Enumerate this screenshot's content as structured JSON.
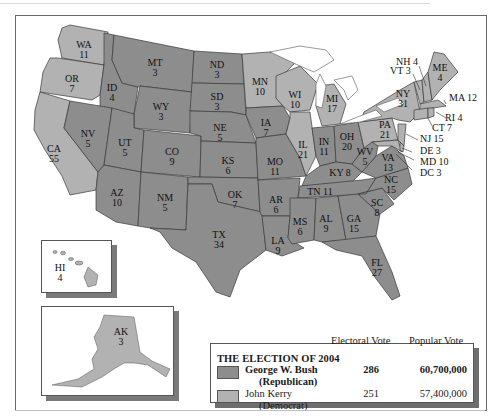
{
  "map": {
    "title": "THE ELECTION OF 2004",
    "colors": {
      "republican": "#8d8d8d",
      "democrat": "#b2b2b2",
      "water": "#ffffff",
      "border": "#3a3a3a"
    },
    "states": {
      "WA": {
        "label": "WA",
        "votes": "11",
        "party": "democrat"
      },
      "OR": {
        "label": "OR",
        "votes": "7",
        "party": "democrat"
      },
      "CA": {
        "label": "CA",
        "votes": "55",
        "party": "democrat"
      },
      "ID": {
        "label": "ID",
        "votes": "4",
        "party": "republican"
      },
      "NV": {
        "label": "NV",
        "votes": "5",
        "party": "republican"
      },
      "MT": {
        "label": "MT",
        "votes": "3",
        "party": "republican"
      },
      "WY": {
        "label": "WY",
        "votes": "3",
        "party": "republican"
      },
      "UT": {
        "label": "UT",
        "votes": "5",
        "party": "republican"
      },
      "CO": {
        "label": "CO",
        "votes": "9",
        "party": "republican"
      },
      "AZ": {
        "label": "AZ",
        "votes": "10",
        "party": "republican"
      },
      "NM": {
        "label": "NM",
        "votes": "5",
        "party": "republican"
      },
      "ND": {
        "label": "ND",
        "votes": "3",
        "party": "republican"
      },
      "SD": {
        "label": "SD",
        "votes": "3",
        "party": "republican"
      },
      "NE": {
        "label": "NE",
        "votes": "5",
        "party": "republican"
      },
      "KS": {
        "label": "KS",
        "votes": "6",
        "party": "republican"
      },
      "OK": {
        "label": "OK",
        "votes": "7",
        "party": "republican"
      },
      "TX": {
        "label": "TX",
        "votes": "34",
        "party": "republican"
      },
      "MN": {
        "label": "MN",
        "votes": "10",
        "party": "democrat"
      },
      "IA": {
        "label": "IA",
        "votes": "7",
        "party": "republican"
      },
      "MO": {
        "label": "MO",
        "votes": "11",
        "party": "republican"
      },
      "AR": {
        "label": "AR",
        "votes": "6",
        "party": "republican"
      },
      "LA": {
        "label": "LA",
        "votes": "9",
        "party": "republican"
      },
      "WI": {
        "label": "WI",
        "votes": "10",
        "party": "democrat"
      },
      "IL": {
        "label": "IL",
        "votes": "21",
        "party": "democrat"
      },
      "MI": {
        "label": "MI",
        "votes": "17",
        "party": "democrat"
      },
      "IN": {
        "label": "IN",
        "votes": "11",
        "party": "republican"
      },
      "OH": {
        "label": "OH",
        "votes": "20",
        "party": "republican"
      },
      "KY": {
        "label": "KY 8",
        "votes": "8",
        "party": "republican"
      },
      "TN": {
        "label": "TN 11",
        "votes": "11",
        "party": "republican"
      },
      "MS": {
        "label": "MS",
        "votes": "6",
        "party": "republican"
      },
      "AL": {
        "label": "AL",
        "votes": "9",
        "party": "republican"
      },
      "GA": {
        "label": "GA",
        "votes": "15",
        "party": "republican"
      },
      "FL": {
        "label": "FL",
        "votes": "27",
        "party": "republican"
      },
      "SC": {
        "label": "SC",
        "votes": "8",
        "party": "republican"
      },
      "NC": {
        "label": "NC",
        "votes": "15",
        "party": "republican"
      },
      "VA": {
        "label": "VA",
        "votes": "13",
        "party": "republican"
      },
      "WV": {
        "label": "WV",
        "votes": "5",
        "party": "republican"
      },
      "PA": {
        "label": "PA",
        "votes": "21",
        "party": "democrat"
      },
      "NY": {
        "label": "NY",
        "votes": "31",
        "party": "democrat"
      },
      "ME": {
        "label": "ME",
        "votes": "4",
        "party": "democrat"
      },
      "NH": {
        "label": "NH 4",
        "votes": "4",
        "party": "democrat"
      },
      "VT": {
        "label": "VT 3",
        "votes": "3",
        "party": "democrat"
      },
      "MA": {
        "label": "MA 12",
        "votes": "12",
        "party": "democrat"
      },
      "RI": {
        "label": "RI 4",
        "votes": "4",
        "party": "democrat"
      },
      "CT": {
        "label": "CT 7",
        "votes": "7",
        "party": "democrat"
      },
      "NJ": {
        "label": "NJ 15",
        "votes": "15",
        "party": "democrat"
      },
      "DE": {
        "label": "DE 3",
        "votes": "3",
        "party": "democrat"
      },
      "MD": {
        "label": "MD 10",
        "votes": "10",
        "party": "democrat"
      },
      "DC": {
        "label": "DC 3",
        "votes": "3",
        "party": "democrat"
      },
      "HI": {
        "label": "HI",
        "votes": "4",
        "party": "democrat"
      },
      "AK": {
        "label": "AK",
        "votes": "3",
        "party": "republican"
      }
    }
  },
  "legend": {
    "title": "THE ELECTION OF 2004",
    "col_electoral": "Electoral Vote",
    "col_popular": "Popular Vote",
    "candidates": [
      {
        "name": "George W. Bush",
        "party": "(Republican)",
        "electoral": "286",
        "popular": "60,700,000",
        "color": "#8d8d8d",
        "bold": true
      },
      {
        "name": "John Kerry",
        "party": "(Democrat)",
        "electoral": "251",
        "popular": "57,400,000",
        "color": "#b2b2b2",
        "bold": false
      }
    ]
  }
}
